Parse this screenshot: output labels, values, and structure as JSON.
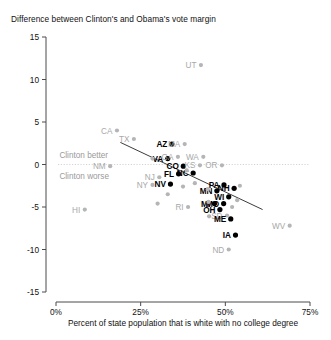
{
  "chart_data": {
    "type": "scatter",
    "title": "Difference between Clinton's and Obama's vote margin",
    "xlabel": "Percent of state population that is white with no college degree",
    "ylabel": "",
    "xlim": [
      0,
      75
    ],
    "ylim": [
      -15,
      15
    ],
    "xticks": [
      "0%",
      "25%",
      "50%",
      "75%"
    ],
    "xtick_values": [
      0,
      25,
      50,
      75
    ],
    "yticks": [
      "15",
      "10",
      "5",
      "0",
      "-5",
      "-10",
      "-15"
    ],
    "ytick_values": [
      15,
      10,
      5,
      0,
      -5,
      -10,
      -15
    ],
    "grid": false,
    "zero_reference_line": true,
    "legend": "none",
    "annotations": [
      {
        "text": "Clinton better",
        "x": 1.0,
        "y": 1.1
      },
      {
        "text": "Clinton worse",
        "x": 1.0,
        "y": -1.4
      }
    ],
    "trend_line": {
      "x1": 19.0,
      "y1": 2.6,
      "x2": 61.0,
      "y2": -5.3
    },
    "highlight_color": "#000000",
    "other_color": "#b5b5b5",
    "points": [
      {
        "label": "UT",
        "x": 42.8,
        "y": 11.7,
        "highlight": false,
        "label_pos": "left"
      },
      {
        "label": "CA",
        "x": 18.0,
        "y": 4.0,
        "highlight": false,
        "label_pos": "left"
      },
      {
        "label": "TX",
        "x": 23.0,
        "y": 3.0,
        "highlight": false,
        "label_pos": "left"
      },
      {
        "label": "AZ",
        "x": 34.2,
        "y": 2.4,
        "highlight": true,
        "label_pos": "left"
      },
      {
        "label": "MA",
        "x": 38.0,
        "y": 2.4,
        "highlight": false,
        "label_pos": "left"
      },
      {
        "label": "VA",
        "x": 33.0,
        "y": 0.7,
        "highlight": true,
        "label_pos": "left"
      },
      {
        "label": "GA",
        "x": 36.0,
        "y": 0.9,
        "highlight": false,
        "label_pos": "left"
      },
      {
        "label": "WA",
        "x": 43.5,
        "y": 0.9,
        "highlight": false,
        "label_pos": "left"
      },
      {
        "label": "CO",
        "x": 37.6,
        "y": -0.2,
        "highlight": true,
        "label_pos": "left"
      },
      {
        "label": "KS",
        "x": 42.5,
        "y": -0.1,
        "highlight": false,
        "label_pos": "left"
      },
      {
        "label": "OR",
        "x": 49.0,
        "y": -0.1,
        "highlight": false,
        "label_pos": "left"
      },
      {
        "label": "NM",
        "x": 16.0,
        "y": -0.2,
        "highlight": false,
        "label_pos": "left"
      },
      {
        "label": "NC",
        "x": 40.5,
        "y": -1.0,
        "highlight": true,
        "label_pos": "left"
      },
      {
        "label": "FL",
        "x": 36.2,
        "y": -1.1,
        "highlight": true,
        "label_pos": "left"
      },
      {
        "label": "NJ",
        "x": 30.5,
        "y": -1.5,
        "highlight": false,
        "label_pos": "left"
      },
      {
        "label": "NV",
        "x": 33.8,
        "y": -2.3,
        "highlight": true,
        "label_pos": "left"
      },
      {
        "label": "NY",
        "x": 28.5,
        "y": -2.4,
        "highlight": false,
        "label_pos": "left"
      },
      {
        "label": "PA",
        "x": 49.6,
        "y": -2.4,
        "highlight": true,
        "label_pos": "left"
      },
      {
        "label": "NH",
        "x": 52.6,
        "y": -2.8,
        "highlight": true,
        "label_pos": "left"
      },
      {
        "label": "MN",
        "x": 47.5,
        "y": -3.1,
        "highlight": true,
        "label_pos": "left"
      },
      {
        "label": "WI",
        "x": 51.0,
        "y": -3.8,
        "highlight": true,
        "label_pos": "left"
      },
      {
        "label": "MI",
        "x": 46.8,
        "y": -4.6,
        "highlight": true,
        "label_pos": "left"
      },
      {
        "label": "MO",
        "x": 49.5,
        "y": -4.6,
        "highlight": true,
        "label_pos": "left"
      },
      {
        "label": "RI",
        "x": 39.0,
        "y": -5.0,
        "highlight": false,
        "label_pos": "left"
      },
      {
        "label": "OH",
        "x": 48.4,
        "y": -5.3,
        "highlight": true,
        "label_pos": "left"
      },
      {
        "label": "SD",
        "x": 50.5,
        "y": -6.0,
        "highlight": false,
        "label_pos": "left"
      },
      {
        "label": "ME",
        "x": 51.6,
        "y": -6.4,
        "highlight": true,
        "label_pos": "left"
      },
      {
        "label": "IA",
        "x": 53.0,
        "y": -8.3,
        "highlight": true,
        "label_pos": "left"
      },
      {
        "label": "WV",
        "x": 69.0,
        "y": -7.2,
        "highlight": false,
        "label_pos": "left"
      },
      {
        "label": "ND",
        "x": 51.0,
        "y": -10.0,
        "highlight": false,
        "label_pos": "left"
      },
      {
        "label": "HI",
        "x": 8.5,
        "y": -5.3,
        "highlight": false,
        "label_pos": "left"
      },
      {
        "label": "",
        "x": 28.5,
        "y": 0.7,
        "highlight": false,
        "label_pos": "none"
      },
      {
        "label": "",
        "x": 38.6,
        "y": -0.7,
        "highlight": false,
        "label_pos": "none"
      },
      {
        "label": "",
        "x": 41.0,
        "y": -2.2,
        "highlight": false,
        "label_pos": "none"
      },
      {
        "label": "",
        "x": 37.5,
        "y": -2.6,
        "highlight": false,
        "label_pos": "none"
      },
      {
        "label": "",
        "x": 44.8,
        "y": -2.9,
        "highlight": false,
        "label_pos": "none"
      },
      {
        "label": "",
        "x": 33.0,
        "y": -3.5,
        "highlight": false,
        "label_pos": "none"
      },
      {
        "label": "",
        "x": 54.3,
        "y": -2.5,
        "highlight": false,
        "label_pos": "none"
      },
      {
        "label": "",
        "x": 53.5,
        "y": -4.2,
        "highlight": false,
        "label_pos": "none"
      },
      {
        "label": "",
        "x": 45.0,
        "y": -4.4,
        "highlight": false,
        "label_pos": "none"
      },
      {
        "label": "",
        "x": 52.0,
        "y": -5.0,
        "highlight": false,
        "label_pos": "none"
      },
      {
        "label": "",
        "x": 45.2,
        "y": -6.1,
        "highlight": false,
        "label_pos": "none"
      },
      {
        "label": "",
        "x": 30.0,
        "y": -4.6,
        "highlight": false,
        "label_pos": "none"
      }
    ]
  }
}
